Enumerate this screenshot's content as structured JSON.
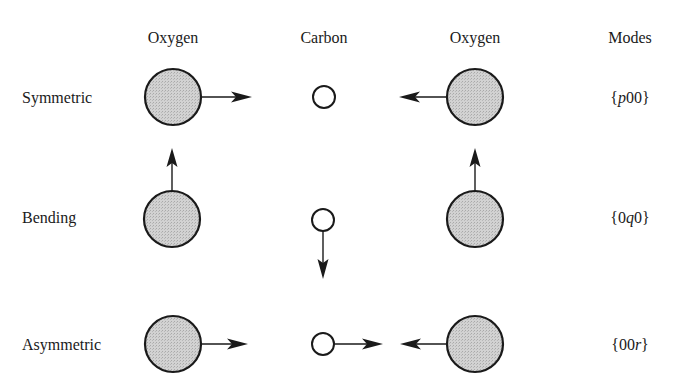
{
  "figure": {
    "columns": [
      {
        "label": "Oxygen",
        "x": 173
      },
      {
        "label": "Carbon",
        "x": 324
      },
      {
        "label": "Oxygen",
        "x": 475
      },
      {
        "label": "Modes",
        "x": 630
      }
    ],
    "rows": [
      {
        "label": "Symmetric",
        "y": 97,
        "mode_prefix": "{",
        "mode_italic": "p",
        "mode_body": "00",
        "mode_suffix": "}",
        "mode_text": "{p00}"
      },
      {
        "label": "Bending",
        "y": 217,
        "mode_prefix": "{0",
        "mode_italic": "q",
        "mode_body": "0",
        "mode_suffix": "}",
        "mode_text": "{0q0}"
      },
      {
        "label": "Asymmetric",
        "y": 344,
        "mode_prefix": "{00",
        "mode_italic": "r",
        "mode_body": "",
        "mode_suffix": "}",
        "mode_text": "{00r}"
      }
    ],
    "atoms": {
      "oxygen_radius": 28,
      "carbon_radius": 11,
      "oxygen_fill": "#cfcfcf",
      "carbon_fill": "#ffffff",
      "stroke": "#1a1a1a"
    },
    "motions": [
      {
        "mode": "Symmetric",
        "atom": "Oxygen-left",
        "direction": "right"
      },
      {
        "mode": "Symmetric",
        "atom": "Carbon",
        "direction": "none"
      },
      {
        "mode": "Symmetric",
        "atom": "Oxygen-right",
        "direction": "left"
      },
      {
        "mode": "Bending",
        "atom": "Oxygen-left",
        "direction": "up"
      },
      {
        "mode": "Bending",
        "atom": "Carbon",
        "direction": "down"
      },
      {
        "mode": "Bending",
        "atom": "Oxygen-right",
        "direction": "up"
      },
      {
        "mode": "Asymmetric",
        "atom": "Oxygen-left",
        "direction": "right"
      },
      {
        "mode": "Asymmetric",
        "atom": "Carbon",
        "direction": "right"
      },
      {
        "mode": "Asymmetric",
        "atom": "Oxygen-right",
        "direction": "left"
      }
    ]
  }
}
